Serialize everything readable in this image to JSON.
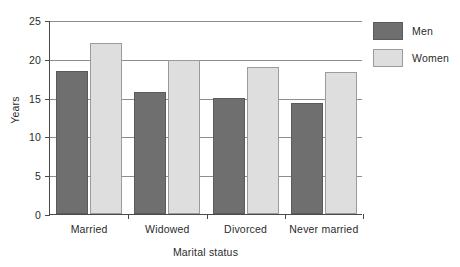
{
  "chart_data": {
    "type": "bar",
    "title": "",
    "subtitle": "",
    "xlabel": "Marital status",
    "ylabel": "Years",
    "categories": [
      "Married",
      "Widowed",
      "Divorced",
      "Never married"
    ],
    "series": [
      {
        "name": "Men",
        "color": "#6f6f6f",
        "values": [
          18.4,
          15.7,
          15.0,
          14.3
        ]
      },
      {
        "name": "Women",
        "color": "#dedede",
        "values": [
          22.0,
          19.8,
          19.0,
          18.3
        ]
      }
    ],
    "ylim": [
      0,
      25
    ],
    "yticks": [
      0,
      5,
      10,
      15,
      20,
      25
    ],
    "ytick_labels": [
      "0",
      "5",
      "10",
      "15",
      "20",
      "25"
    ],
    "grid": "horizontal",
    "legend_position": "right",
    "legend_entries": [
      "Men",
      "Women"
    ]
  },
  "axes": {
    "y_title": "Years",
    "x_title": "Marital status",
    "y_labels": [
      "25",
      "20",
      "15",
      "10",
      "5",
      "0"
    ],
    "x_labels": [
      "Married",
      "Widowed",
      "Divorced",
      "Never married"
    ]
  },
  "legend": {
    "items": [
      {
        "label": "Men",
        "swatch": "men-swatch"
      },
      {
        "label": "Women",
        "swatch": "women-swatch"
      }
    ]
  }
}
